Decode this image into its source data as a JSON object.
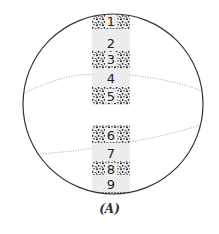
{
  "figure": {
    "caption": "(A)",
    "bands": [
      {
        "label": "1",
        "type": "dark"
      },
      {
        "label": "2",
        "type": "light"
      },
      {
        "label": "3",
        "type": "dark"
      },
      {
        "label": "4",
        "type": "light"
      },
      {
        "label": "5",
        "type": "dark"
      },
      {
        "label": "6",
        "type": "dark"
      },
      {
        "label": "7",
        "type": "light"
      },
      {
        "label": "8",
        "type": "dark"
      },
      {
        "label": "9",
        "type": "light"
      }
    ],
    "colors": {
      "outline": "#333333",
      "dark_band": "#2a2a2a",
      "light_band": "#d6d6d6",
      "dotted_line": "#888888"
    }
  }
}
